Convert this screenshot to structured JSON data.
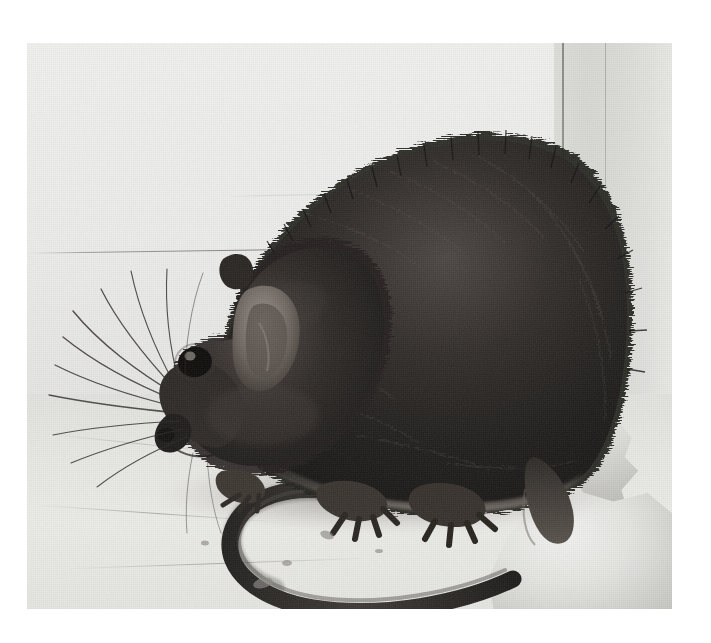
{
  "image": {
    "type": "photograph",
    "medium": "black-and-white / grayscale halftone print",
    "subject": "rat",
    "caption": "",
    "width_px": 711,
    "height_px": 643,
    "plate": {
      "left_px": 27,
      "top_px": 43,
      "width_px": 645,
      "height_px": 566
    },
    "border_color": "#ffffff"
  },
  "scene": {
    "description": "A dark-furred rat crouched in the corner of a pale room, facing left, tail curled in a C-shape on the floor.",
    "background_label": "pale plaster wall and floor corner",
    "wall_color": "#eeeeec",
    "floor_color": "#e9e9e6",
    "corner_shadow_color": "#d9d9d5",
    "fur_color": "#1d1c1b",
    "fur_highlight_color": "#6b6763",
    "tail_color": "#2a2826",
    "ear_color": "#7a736d",
    "eye_color": "#0a0a0a",
    "debris_color": "#d2d2ce"
  },
  "elements": {
    "rat_body": "rat-body",
    "rat_head": "rat-head",
    "rat_ear": "rat-ear",
    "rat_eye": "rat-eye",
    "rat_snout": "rat-snout",
    "whiskers": "whiskers",
    "front_paw": "front-paw",
    "hind_foot": "hind-foot",
    "tail": "tail",
    "wall_crack": "wall-crack",
    "corner_edge": "corner-edge",
    "paper_debris": "paper-debris"
  }
}
